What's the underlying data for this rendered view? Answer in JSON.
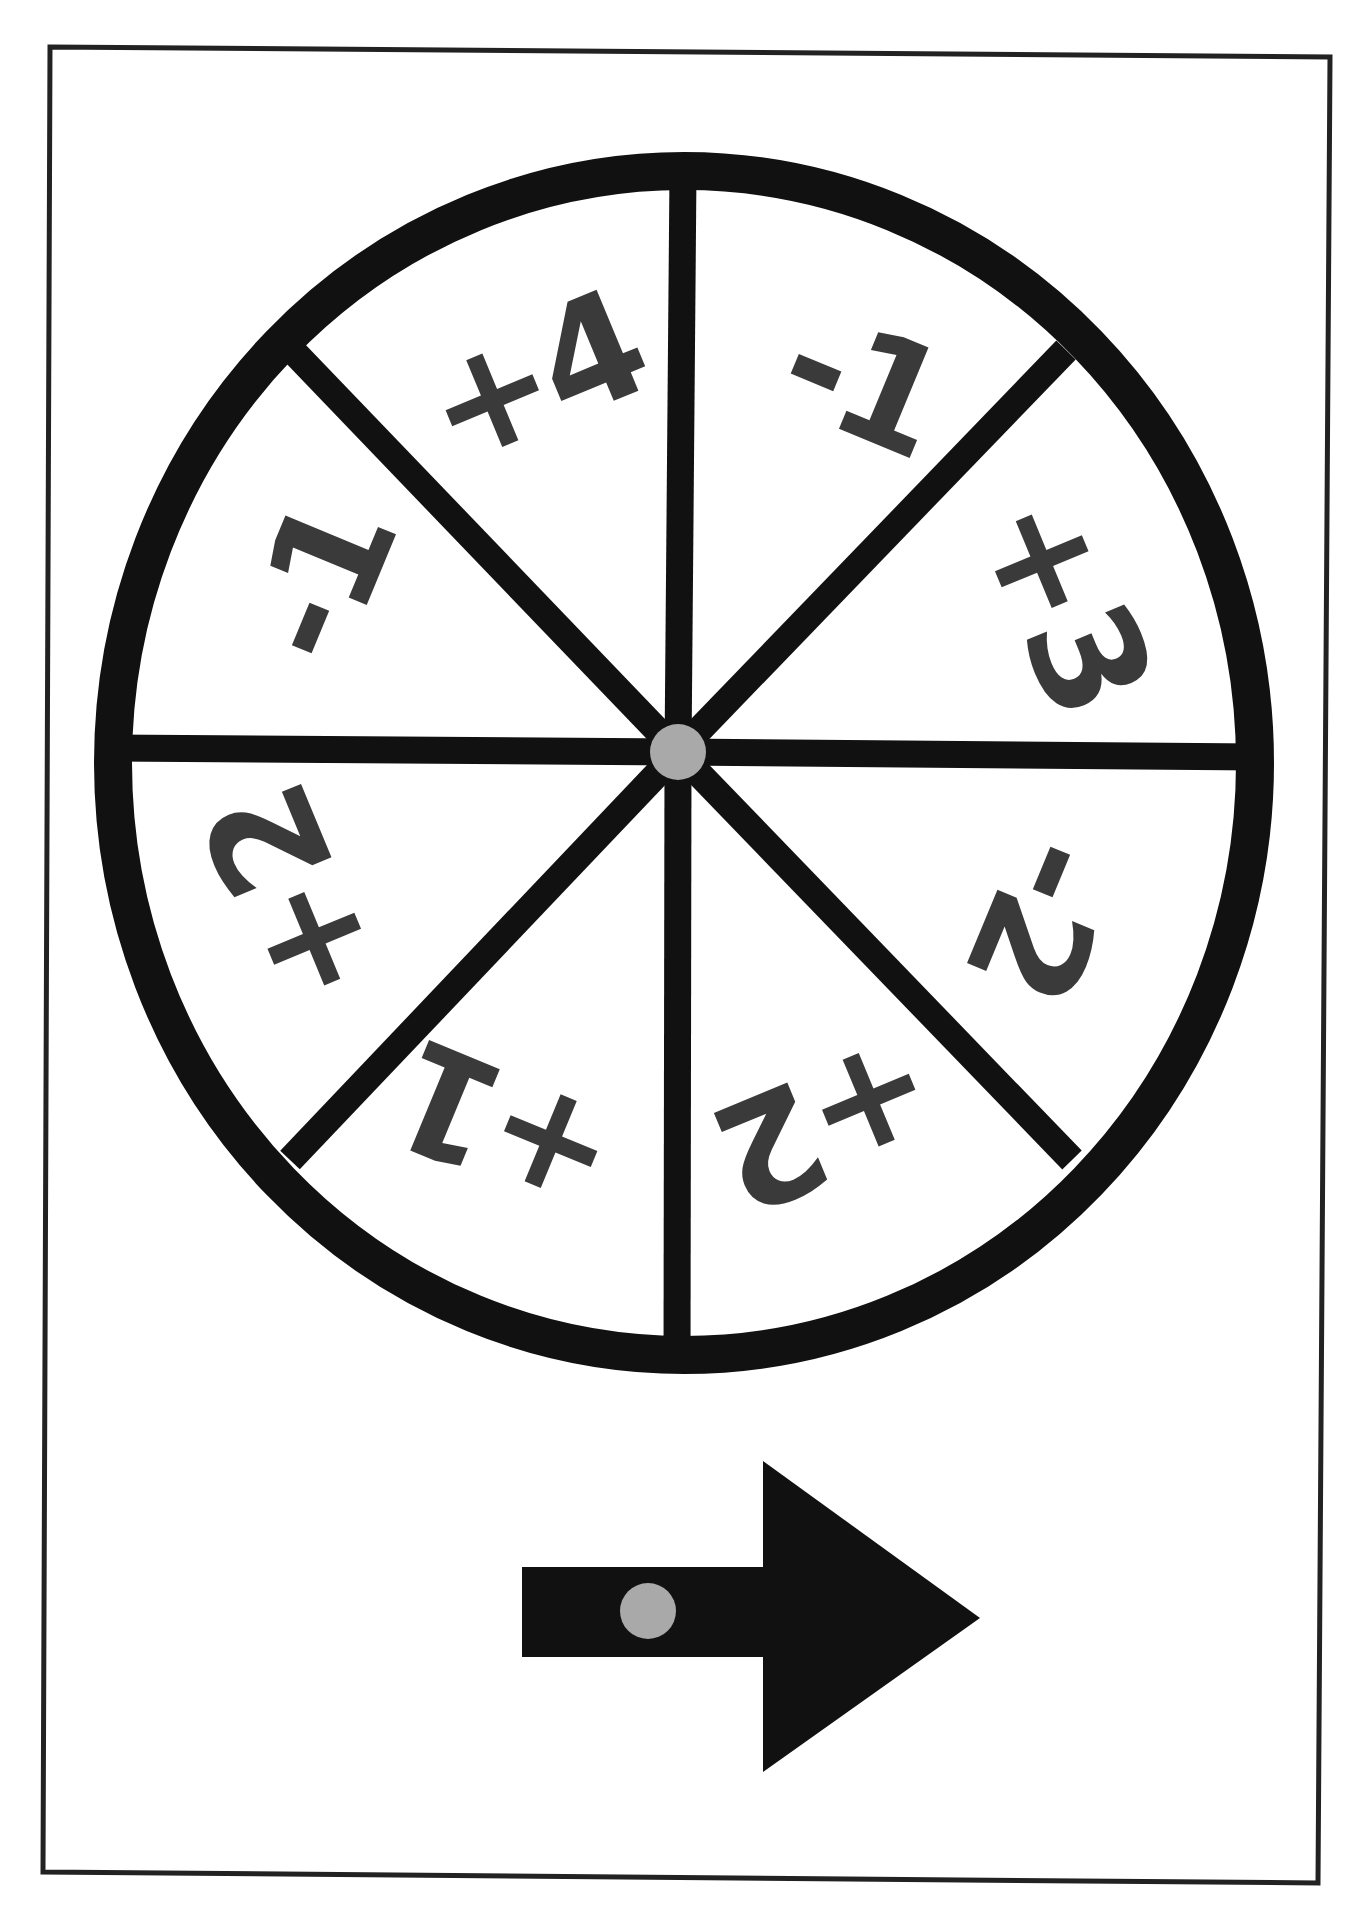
{
  "page": {
    "background": "#ffffff",
    "border": {
      "points": [
        [
          50,
          47
        ],
        [
          1330,
          57
        ],
        [
          1318,
          1883
        ],
        [
          43,
          1872
        ]
      ],
      "color": "#222222",
      "width": 5
    }
  },
  "spinner": {
    "title": "Spinner wheel",
    "center": [
      678,
      752
    ],
    "ellipse": {
      "cx": 684,
      "cy": 763,
      "rx": 571,
      "ry": 592
    },
    "rim_color": "#111111",
    "rim_width": 38,
    "spoke_color": "#111111",
    "spoke_width": 27,
    "spoke_ends": [
      [
        683,
        172
      ],
      [
        1066,
        350
      ],
      [
        1257,
        757
      ],
      [
        1072,
        1160
      ],
      [
        677,
        1357
      ],
      [
        290,
        1160
      ],
      [
        112,
        748
      ],
      [
        292,
        350
      ]
    ],
    "hub": {
      "radius": 28,
      "color": "#a9a9a9"
    },
    "label_color": "#3a3a3a",
    "segments": [
      {
        "label": "+4",
        "x": 533,
        "y": 378,
        "rotate": -22.5
      },
      {
        "label": "-1",
        "x": 862,
        "y": 382,
        "rotate": 22.5
      },
      {
        "label": "+3",
        "x": 1064,
        "y": 602,
        "rotate": 67.5
      },
      {
        "label": "-2",
        "x": 1042,
        "y": 918,
        "rotate": 112.5
      },
      {
        "label": "+2",
        "x": 828,
        "y": 1122,
        "rotate": 157.5
      },
      {
        "label": "+1",
        "x": 506,
        "y": 1128,
        "rotate": 202.5
      },
      {
        "label": "+2",
        "x": 292,
        "y": 898,
        "rotate": 247.5
      },
      {
        "label": "-1",
        "x": 320,
        "y": 582,
        "rotate": 292.5
      }
    ]
  },
  "pointer": {
    "title": "Spinner arrow pointer",
    "color": "#111111",
    "shaft": {
      "x": 522,
      "y": 1567,
      "width": 241,
      "height": 90
    },
    "head": [
      [
        763,
        1461
      ],
      [
        980,
        1618
      ],
      [
        763,
        1772
      ]
    ],
    "pivot": {
      "cx": 648,
      "cy": 1611,
      "r": 28,
      "color": "#a9a9a9"
    }
  }
}
